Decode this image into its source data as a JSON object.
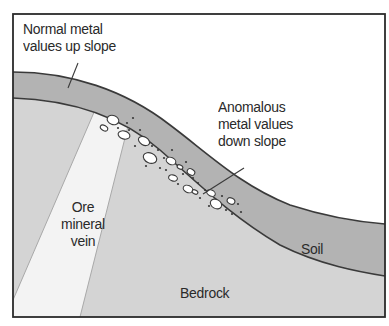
{
  "diagram": {
    "type": "geological cross-section",
    "labels": {
      "normal_line1": "Normal metal",
      "normal_line2": "values up slope",
      "anomalous_line1": "Anomalous",
      "anomalous_line2": "metal values",
      "anomalous_line3": "down slope",
      "ore_line1": "Ore",
      "ore_line2": "mineral",
      "ore_line3": "vein",
      "soil": "Soil",
      "bedrock": "Bedrock"
    },
    "layers": [
      {
        "name": "Soil",
        "color": "#b3b3b3"
      },
      {
        "name": "Bedrock",
        "color": "#d4d4d4"
      },
      {
        "name": "Ore mineral vein",
        "color": "#f3f3f3"
      },
      {
        "name": "Sky",
        "color": "#ffffff"
      }
    ],
    "colors": {
      "frame": "#2b2b2b",
      "outline": "#3a3a3a",
      "soil": "#b3b3b3",
      "bedrock": "#d4d4d4",
      "vein": "#f3f3f3"
    }
  }
}
